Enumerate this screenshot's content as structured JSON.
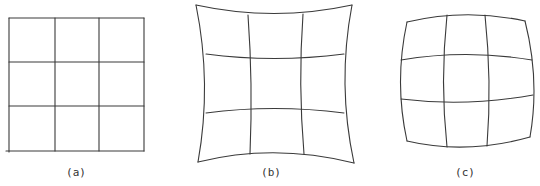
{
  "figure": {
    "panels": [
      {
        "id": "a",
        "label": "(a)",
        "type": "undistorted",
        "label_pos": [
          76,
          176
        ],
        "paths": [
          "M9 18 L144 18",
          "M9 62 L144 62",
          "M9 106 L144 106",
          "M6 151 L144 151",
          "M9 18 L9 152",
          "M55 18 L55 151",
          "M99 18 L99 151",
          "M144 18 L144 151"
        ]
      },
      {
        "id": "b",
        "label": "(b)",
        "type": "pincushion",
        "label_pos": [
          271,
          176
        ],
        "paths": [
          "M196 5 Q274 22 352 5",
          "M206 54 Q274 63 344 54",
          "M206 113 Q274 104 344 113",
          "M198 162 Q274 143 354 163",
          "M196 5 Q212 84 198 162",
          "M248 15 Q253 84 250 154",
          "M303 14 Q298 84 304 154",
          "M352 5 Q337 84 354 163"
        ]
      },
      {
        "id": "c",
        "label": "(c)",
        "type": "barrel",
        "label_pos": [
          465,
          176
        ],
        "paths": [
          "M407 22 Q466 8 525 21",
          "M401 60 Q466 49 532 60",
          "M401 99 Q466 107 533 95",
          "M407 141 Q466 155 530 137",
          "M407 22 Q394 82 407 141",
          "M447 15 Q440 82 447 147",
          "M485 15 Q492 82 487 146",
          "M525 21 Q540 80 530 137"
        ]
      }
    ]
  }
}
